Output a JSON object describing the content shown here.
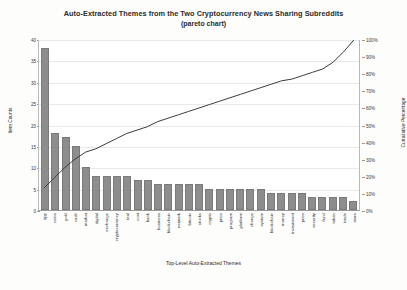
{
  "chart_data": {
    "type": "bar",
    "title": "Auto-Extracted Themes from the Two Cryptocurrency News Sharing Subreddits",
    "subtitle": "(pareto chart)",
    "xlabel": "Top-Level Auto-Extracted Themes",
    "ylabel": "Item Counts",
    "y2label": "Cumulative Percentage",
    "grid": true,
    "legend": "none",
    "ylim": [
      0,
      40
    ],
    "y2lim": [
      0,
      1
    ],
    "yticks": [
      "0",
      "5",
      "10",
      "15",
      "20",
      "25",
      "30",
      "35",
      "40"
    ],
    "y2ticks": [
      "0%",
      "10%",
      "20%",
      "30%",
      "40%",
      "50%",
      "60%",
      "70%",
      "80%",
      "90%",
      "100%"
    ],
    "categories": [
      "app",
      "coins",
      "gold",
      "cash",
      "market",
      "digital",
      "exchange",
      "cryptocurrency",
      "real",
      "cost",
      "bank",
      "business",
      "blockchain",
      "network",
      "bitcoin",
      "stocks",
      "crypto",
      "price",
      "program",
      "platform",
      "change",
      "system",
      "blockchain",
      "money",
      "investment",
      "price",
      "security",
      "fund",
      "token",
      "trade",
      "store"
    ],
    "values": [
      38,
      18,
      17,
      15,
      10,
      8,
      8,
      8,
      8,
      7,
      7,
      6,
      6,
      6,
      6,
      6,
      5,
      5,
      5,
      5,
      5,
      5,
      4,
      4,
      4,
      4,
      3,
      3,
      3,
      3,
      2
    ],
    "cumulative_percent": [
      0.13,
      0.19,
      0.25,
      0.3,
      0.34,
      0.36,
      0.39,
      0.42,
      0.45,
      0.47,
      0.49,
      0.52,
      0.54,
      0.56,
      0.58,
      0.6,
      0.62,
      0.64,
      0.66,
      0.68,
      0.7,
      0.72,
      0.74,
      0.76,
      0.77,
      0.79,
      0.81,
      0.83,
      0.87,
      0.93,
      1.0
    ],
    "bar_color": "#8d8d8d",
    "line_color": "#3d3d3d"
  }
}
